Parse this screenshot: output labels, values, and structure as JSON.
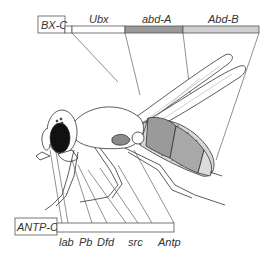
{
  "diagram": {
    "type": "gene-complex-to-body-mapping",
    "top_complex": {
      "name": "BX-C",
      "genes": [
        {
          "label": "Ubx",
          "color": "#ffffff"
        },
        {
          "label": "abd-A",
          "color": "#9a9a9a"
        },
        {
          "label": "Abd-B",
          "color": "#cfcfcf"
        }
      ]
    },
    "bottom_complex": {
      "name": "ANTP-C",
      "genes": [
        {
          "label": "lab"
        },
        {
          "label": "Pb"
        },
        {
          "label": "Dfd"
        },
        {
          "label": "src"
        },
        {
          "label": "Antp"
        }
      ]
    },
    "colors": {
      "line": "#333333",
      "abd_a_fill": "#9a9a9a",
      "abd_b_fill": "#cfcfcf",
      "eye": "#111111"
    }
  }
}
